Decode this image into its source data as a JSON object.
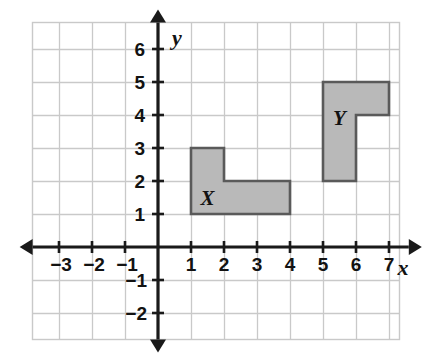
{
  "figure": {
    "kind": "coordinate-plane",
    "background_color": "#ffffff",
    "frame": {
      "color": "#c9c9c9",
      "x": 32,
      "y": 22,
      "width": 368,
      "height": 318
    },
    "grid": {
      "color": "#c9c9c9",
      "spacing_px": 33,
      "origin_px": {
        "x": 158,
        "y": 247
      },
      "columns": 11,
      "rows": 9
    },
    "axes": {
      "color": "#1a1a1a",
      "x_axis": {
        "label": "x",
        "arrows": "both",
        "range": [
          -3.8,
          7.6
        ]
      },
      "y_axis": {
        "label": "y",
        "arrows": "both",
        "range": [
          -2.8,
          6.8
        ]
      }
    }
  },
  "ticks": {
    "x_negative": [
      "−3",
      "−2",
      "−1"
    ],
    "x_positive": [
      "1",
      "2",
      "3",
      "4",
      "5",
      "6",
      "7"
    ],
    "y_positive": [
      "1",
      "2",
      "3",
      "4",
      "5",
      "6"
    ],
    "y_negative": [
      "−1",
      "−2"
    ]
  },
  "chart_data": {
    "type": "scatter",
    "title": "",
    "xlabel": "x",
    "ylabel": "y",
    "xlim": [
      -4,
      8
    ],
    "ylim": [
      -3,
      7
    ],
    "grid": true,
    "legend": "none",
    "x_ticks": [
      -3,
      -2,
      -1,
      1,
      2,
      3,
      4,
      5,
      6,
      7
    ],
    "y_ticks": [
      -2,
      -1,
      1,
      2,
      3,
      4,
      5,
      6
    ],
    "shapes": [
      {
        "name": "X",
        "label": "X",
        "label_position": {
          "x": 1.5,
          "y": 1.5
        },
        "fill": "#b9b9b9",
        "stroke": "#5a5a5a",
        "vertices": [
          {
            "x": 1,
            "y": 3
          },
          {
            "x": 2,
            "y": 3
          },
          {
            "x": 2,
            "y": 2
          },
          {
            "x": 4,
            "y": 2
          },
          {
            "x": 4,
            "y": 1
          },
          {
            "x": 1,
            "y": 1
          }
        ],
        "area_units": 5
      },
      {
        "name": "Y",
        "label": "Y",
        "label_position": {
          "x": 5.5,
          "y": 3.9
        },
        "fill": "#b9b9b9",
        "stroke": "#5a5a5a",
        "vertices": [
          {
            "x": 5,
            "y": 5
          },
          {
            "x": 7,
            "y": 5
          },
          {
            "x": 7,
            "y": 4
          },
          {
            "x": 6,
            "y": 4
          },
          {
            "x": 6,
            "y": 2
          },
          {
            "x": 5,
            "y": 2
          }
        ],
        "area_units": 5
      }
    ]
  }
}
